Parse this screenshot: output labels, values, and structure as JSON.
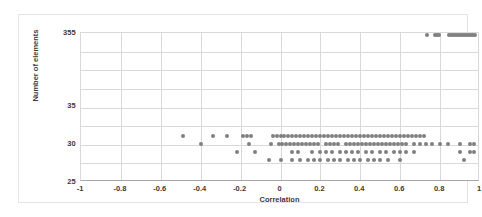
{
  "chart_data": {
    "type": "scatter",
    "title": "",
    "xlabel": "Correlation",
    "ylabel": "Number of elements",
    "xlim": [
      -1,
      1
    ],
    "ylim": [
      25,
      355
    ],
    "grid": true,
    "legend": false,
    "marker_color": "#808080",
    "marker_shape": "circle",
    "xticks": [
      "-1",
      "-0.8",
      "-0.6",
      "-0.4",
      "-0.2",
      "0",
      "0.2",
      "0.4",
      "0.6",
      "0.8",
      "1"
    ],
    "xtick_values": [
      -1,
      -0.8,
      -0.6,
      -0.4,
      -0.2,
      0,
      0.2,
      0.4,
      0.6,
      0.8,
      1
    ],
    "yticks": [
      "355",
      "35",
      "30",
      "25"
    ],
    "ytick_values": [
      355,
      35,
      30,
      25
    ],
    "note": "Y axis is visually broken: 355 sits at the top of the plot, while 35, 30 and 25 are evenly spaced in the lower third.",
    "series": [
      {
        "name": "elements",
        "points_355": [
          0.735,
          0.775,
          0.785,
          0.795,
          0.845,
          0.855,
          0.865,
          0.875,
          0.885,
          0.895,
          0.905,
          0.915,
          0.925,
          0.935,
          0.945,
          0.955,
          0.965,
          0.975
        ],
        "points_31": [
          -0.49,
          -0.34,
          -0.27,
          -0.19,
          -0.17,
          -0.15,
          -0.04,
          -0.02,
          0.0,
          0.02,
          0.04,
          0.06,
          0.08,
          0.1,
          0.12,
          0.14,
          0.16,
          0.18,
          0.2,
          0.22,
          0.24,
          0.26,
          0.28,
          0.3,
          0.32,
          0.34,
          0.36,
          0.38,
          0.4,
          0.42,
          0.44,
          0.46,
          0.48,
          0.5,
          0.52,
          0.54,
          0.56,
          0.58,
          0.6,
          0.62,
          0.64,
          0.66,
          0.68,
          0.7,
          0.72
        ],
        "points_30": [
          -0.4,
          -0.16,
          -0.05,
          -0.01,
          0.01,
          0.03,
          0.05,
          0.07,
          0.09,
          0.11,
          0.13,
          0.15,
          0.17,
          0.19,
          0.23,
          0.25,
          0.27,
          0.29,
          0.33,
          0.35,
          0.37,
          0.39,
          0.41,
          0.43,
          0.45,
          0.47,
          0.49,
          0.51,
          0.53,
          0.55,
          0.57,
          0.59,
          0.61,
          0.63,
          0.67,
          0.7,
          0.73,
          0.76,
          0.8,
          0.84,
          0.9,
          0.95,
          0.97
        ],
        "points_29": [
          -0.22,
          -0.13,
          0.06,
          0.09,
          0.16,
          0.2,
          0.23,
          0.26,
          0.3,
          0.33,
          0.36,
          0.39,
          0.43,
          0.46,
          0.5,
          0.53,
          0.57,
          0.6,
          0.63,
          0.67,
          0.9,
          0.95,
          0.97
        ],
        "points_28": [
          -0.06,
          0.0,
          0.06,
          0.1,
          0.14,
          0.17,
          0.2,
          0.24,
          0.27,
          0.3,
          0.34,
          0.37,
          0.4,
          0.44,
          0.47,
          0.5,
          0.54,
          0.6,
          0.92
        ]
      }
    ]
  }
}
